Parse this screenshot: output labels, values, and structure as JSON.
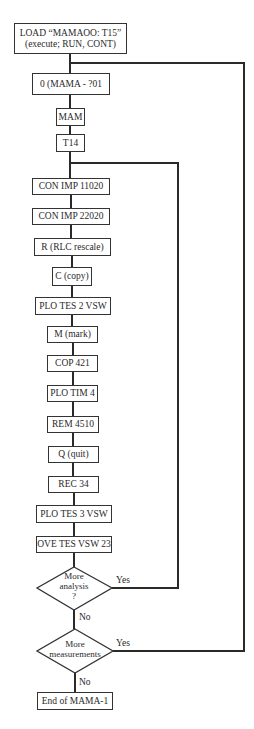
{
  "flowchart": {
    "steps": [
      {
        "id": "load",
        "line1": "LOAD “MAMAOO:  T15”",
        "line2": "(execute;  RUN, CONT)"
      },
      {
        "id": "mama",
        "label": "0 (MAMA - ?01"
      },
      {
        "id": "mam",
        "label": "MAM"
      },
      {
        "id": "t14",
        "label": "T14"
      },
      {
        "id": "conimp1",
        "label": "CON IMP 11020"
      },
      {
        "id": "conimp2",
        "label": "CON IMP 22020"
      },
      {
        "id": "rescale",
        "label": "R (RLC rescale)"
      },
      {
        "id": "copy",
        "label": "C (copy)"
      },
      {
        "id": "plotes2",
        "label": "PLO TES 2 VSW"
      },
      {
        "id": "mark",
        "label": "M (mark)"
      },
      {
        "id": "cop421",
        "label": "COP 421"
      },
      {
        "id": "plotim4",
        "label": "PLO TIM 4"
      },
      {
        "id": "rem4510",
        "label": "REM 4510"
      },
      {
        "id": "quit",
        "label": "Q (quit)"
      },
      {
        "id": "rec34",
        "label": "REC 34"
      },
      {
        "id": "plotes3",
        "label": "PLO TES 3 VSW"
      },
      {
        "id": "ovetes",
        "label": "OVE TES VSW 23"
      }
    ],
    "decisions": [
      {
        "id": "more-analysis",
        "line1": "More",
        "line2": "analysis",
        "line3": "?",
        "yes": "Yes",
        "no": "No"
      },
      {
        "id": "more-measurements",
        "line1": "More",
        "line2": "measurements",
        "yes": "Yes",
        "no": "No"
      }
    ],
    "end": {
      "label": "End of MAMA-1"
    }
  }
}
